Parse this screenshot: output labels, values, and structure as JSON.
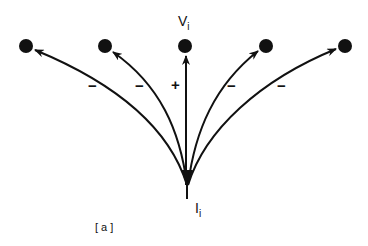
{
  "diagram": {
    "colors": {
      "ink": "#111111",
      "background": "#ffffff"
    },
    "source": {
      "label": "I",
      "subscript": "i",
      "x": 187,
      "y": 186
    },
    "target_label": {
      "label": "V",
      "subscript": "i"
    },
    "nodes": [
      {
        "id": "n1",
        "x": 26,
        "y": 46,
        "sign": "−"
      },
      {
        "id": "n2",
        "x": 105,
        "y": 46,
        "sign": "−"
      },
      {
        "id": "n3",
        "x": 185,
        "y": 46,
        "sign": "+"
      },
      {
        "id": "n4",
        "x": 266,
        "y": 46,
        "sign": "−"
      },
      {
        "id": "n5",
        "x": 345,
        "y": 46,
        "sign": "−"
      }
    ],
    "caption": "[ a ]"
  }
}
